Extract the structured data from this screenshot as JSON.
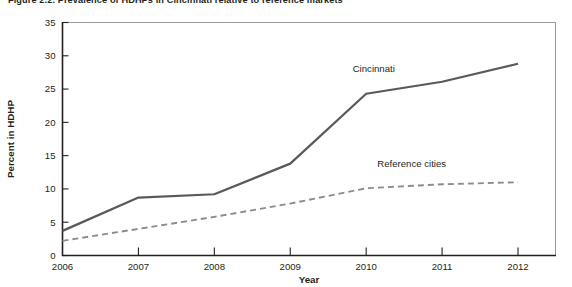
{
  "figure": {
    "title": "Figure 2.2. Prevalence of HDHPs in Cincinnati relative to reference markets"
  },
  "chart_data": {
    "type": "line",
    "title": "Figure 2.2. Prevalence of HDHPs in Cincinnati relative to reference markets",
    "xlabel": "Year",
    "ylabel": "Percent in HDHP",
    "categories": [
      "2006",
      "2007",
      "2008",
      "2009",
      "2010",
      "2011",
      "2012"
    ],
    "x": [
      2006,
      2007,
      2008,
      2009,
      2010,
      2011,
      2012
    ],
    "xlim": [
      2006,
      2012
    ],
    "ylim": [
      0,
      35
    ],
    "yticks": [
      0,
      5,
      10,
      15,
      20,
      25,
      30,
      35
    ],
    "ytick_labels": [
      "0",
      "5",
      "10",
      "15",
      "20",
      "25",
      "30",
      "35"
    ],
    "grid": false,
    "legend": "inline-labels",
    "series": [
      {
        "name": "Cincinnati",
        "style": "solid",
        "color": "#58595b",
        "values": [
          3.7,
          8.7,
          9.2,
          13.8,
          24.3,
          26.1,
          28.8
        ],
        "label_x": 2010.1,
        "label_y": 27.5
      },
      {
        "name": "Reference cities",
        "style": "dashed",
        "color": "#8c8c8c",
        "values": [
          2.2,
          4.0,
          5.8,
          7.8,
          10.1,
          10.7,
          11.0
        ],
        "label_x": 2010.6,
        "label_y": 13.3
      }
    ]
  },
  "axes": {
    "y_title": "Percent in HDHP",
    "x_title": "Year"
  }
}
